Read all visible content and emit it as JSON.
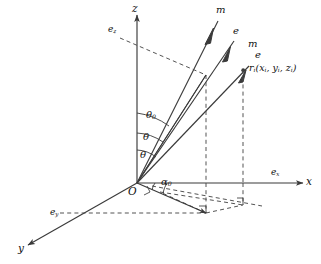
{
  "figure": {
    "background": "#ffffff",
    "stroke": "#3a3a3a",
    "dash_stroke": "#4a4a4a",
    "text_color": "#111111",
    "width": 321,
    "height": 264
  },
  "axes": {
    "x": {
      "label": "x",
      "unit_label": "e",
      "unit_sub": "x"
    },
    "y": {
      "label": "y",
      "unit_label": "e",
      "unit_sub": "y"
    },
    "z": {
      "label": "z",
      "unit_label": "e",
      "unit_sub": "z"
    }
  },
  "origin": {
    "label": "O"
  },
  "vectors": [
    {
      "name": "ray-1",
      "head_label": "m"
    },
    {
      "name": "ray-2",
      "head_label": "e"
    },
    {
      "name": "ray-3-m",
      "head_label": "m"
    },
    {
      "name": "ray-3-e",
      "head_label": "e"
    }
  ],
  "position_vector": {
    "symbol": "r",
    "symbol_sub": "i",
    "components": "(x",
    "full": "r",
    "coords_x": "x",
    "coords_y": "y",
    "coords_z": "z",
    "coords_sub": "i",
    "open": "(",
    "close": ")",
    "sep": ", "
  },
  "angles": [
    {
      "name": "theta-0",
      "symbol": "θ",
      "sub": "0"
    },
    {
      "name": "theta-mid",
      "symbol": "θ",
      "sub": ""
    },
    {
      "name": "theta-low",
      "symbol": "θ",
      "sub": ""
    },
    {
      "name": "alpha-0",
      "symbol": "α",
      "sub": "0"
    }
  ]
}
